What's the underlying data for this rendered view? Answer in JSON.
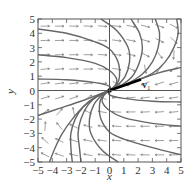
{
  "chart_data": {
    "type": "line",
    "subtype": "phase-portrait-direction-field",
    "title": "",
    "xlabel": "x",
    "ylabel": "y",
    "xlim": [
      -5,
      5
    ],
    "ylim": [
      -5,
      5
    ],
    "x_ticks": [
      "−5",
      "−4",
      "−3",
      "−2",
      "−1",
      "0",
      "1",
      "2",
      "3",
      "4",
      "5"
    ],
    "y_ticks": [
      "−5",
      "−4",
      "−3",
      "−2",
      "−1",
      "0",
      "1",
      "2",
      "3",
      "4",
      "5"
    ],
    "grid": false,
    "annotations": [
      {
        "text": "v",
        "subscript": "1",
        "x": 2.3,
        "y": 0.55
      }
    ],
    "eigenvector_line": {
      "label": "v1",
      "slope": 0.35,
      "points": [
        [
          0,
          0
        ],
        [
          2.2,
          0.77
        ]
      ]
    },
    "field_model": {
      "a": -1.7,
      "b": 3.0,
      "c": -0.35,
      "d": -0.3
    },
    "trajectories": [
      {
        "name": "t1",
        "points": [
          [
            -5,
            4.3
          ],
          [
            -3,
            4.0
          ],
          [
            -1,
            3.4
          ],
          [
            0,
            2.9
          ],
          [
            0.6,
            2.0
          ],
          [
            0.7,
            1.0
          ],
          [
            0.5,
            0.4
          ],
          [
            0,
            0
          ]
        ]
      },
      {
        "name": "t2",
        "points": [
          [
            -5,
            2.5
          ],
          [
            -3,
            2.3
          ],
          [
            -1,
            1.9
          ],
          [
            0,
            1.4
          ],
          [
            0.5,
            0.8
          ],
          [
            0.4,
            0.35
          ],
          [
            0,
            0
          ]
        ]
      },
      {
        "name": "t3",
        "points": [
          [
            -5,
            0.8
          ],
          [
            -3,
            0.75
          ],
          [
            -1,
            0.55
          ],
          [
            0,
            0.3
          ],
          [
            0,
            0
          ]
        ]
      },
      {
        "name": "t4",
        "points": [
          [
            -0.6,
            5
          ],
          [
            0.5,
            4.2
          ],
          [
            1.3,
            3.0
          ],
          [
            1.4,
            2.0
          ],
          [
            1.1,
            1.0
          ],
          [
            0.5,
            0.3
          ],
          [
            0,
            0
          ]
        ]
      },
      {
        "name": "t5",
        "points": [
          [
            1.5,
            5
          ],
          [
            2.1,
            4.0
          ],
          [
            2.3,
            3.0
          ],
          [
            2.1,
            2.0
          ],
          [
            1.6,
            1.0
          ],
          [
            0.8,
            0.35
          ],
          [
            0,
            0
          ]
        ]
      },
      {
        "name": "t6",
        "points": [
          [
            3.2,
            5
          ],
          [
            3.5,
            4.0
          ],
          [
            3.4,
            3.0
          ],
          [
            3.0,
            2.0
          ],
          [
            2.3,
            1.15
          ],
          [
            1.2,
            0.45
          ],
          [
            0,
            0
          ]
        ]
      },
      {
        "name": "t7",
        "points": [
          [
            4.7,
            5
          ],
          [
            4.8,
            4.0
          ],
          [
            4.5,
            3.0
          ],
          [
            3.9,
            2.0
          ],
          [
            3.0,
            1.2
          ],
          [
            1.5,
            0.55
          ],
          [
            0,
            0
          ]
        ]
      },
      {
        "name": "t8",
        "points": [
          [
            5,
            1.6
          ],
          [
            3.5,
            1.25
          ],
          [
            2,
            0.75
          ],
          [
            1,
            0.38
          ],
          [
            0,
            0
          ]
        ]
      },
      {
        "name": "t9",
        "points": [
          [
            5,
            -0.8
          ],
          [
            3,
            -0.75
          ],
          [
            1,
            -0.55
          ],
          [
            0,
            -0.3
          ],
          [
            0,
            0
          ]
        ]
      },
      {
        "name": "t10",
        "points": [
          [
            5,
            -2.5
          ],
          [
            3,
            -2.3
          ],
          [
            1,
            -1.9
          ],
          [
            0,
            -1.4
          ],
          [
            -0.5,
            -0.8
          ],
          [
            -0.4,
            -0.35
          ],
          [
            0,
            0
          ]
        ]
      },
      {
        "name": "t11",
        "points": [
          [
            5,
            -4.5
          ],
          [
            3,
            -4.0
          ],
          [
            1,
            -3.4
          ],
          [
            0,
            -2.9
          ],
          [
            -0.6,
            -2.0
          ],
          [
            -0.7,
            -1.0
          ],
          [
            -0.5,
            -0.4
          ],
          [
            0,
            0
          ]
        ]
      },
      {
        "name": "t12",
        "points": [
          [
            0.6,
            -5
          ],
          [
            -0.5,
            -4.2
          ],
          [
            -1.3,
            -3.0
          ],
          [
            -1.4,
            -2.0
          ],
          [
            -1.1,
            -1.0
          ],
          [
            -0.5,
            -0.3
          ],
          [
            0,
            0
          ]
        ]
      },
      {
        "name": "t13",
        "points": [
          [
            -2.0,
            -5
          ],
          [
            -2.1,
            -4.0
          ],
          [
            -2.2,
            -3.0
          ],
          [
            -2.0,
            -2.0
          ],
          [
            -1.5,
            -1.0
          ],
          [
            -0.8,
            -0.35
          ],
          [
            0,
            0
          ]
        ]
      },
      {
        "name": "t14",
        "points": [
          [
            -2.6,
            -5
          ],
          [
            -2.7,
            -4.0
          ],
          [
            -2.7,
            -3.0
          ],
          [
            -2.4,
            -2.0
          ],
          [
            -1.8,
            -1.1
          ],
          [
            -0.9,
            -0.4
          ],
          [
            0,
            0
          ]
        ]
      },
      {
        "name": "t15",
        "points": [
          [
            -4.2,
            -5
          ],
          [
            -3.8,
            -4.0
          ],
          [
            -3.3,
            -3.0
          ],
          [
            -2.6,
            -2.0
          ],
          [
            -1.8,
            -1.1
          ],
          [
            -0.9,
            -0.45
          ],
          [
            0,
            0
          ]
        ]
      },
      {
        "name": "t16",
        "points": [
          [
            -5,
            -1.75
          ],
          [
            -3.5,
            -1.25
          ],
          [
            -2,
            -0.75
          ],
          [
            -1,
            -0.38
          ],
          [
            0,
            0
          ]
        ]
      }
    ]
  },
  "labels": {
    "x_axis": "x",
    "y_axis": "y",
    "v_main": "v",
    "v_sub": "1"
  }
}
